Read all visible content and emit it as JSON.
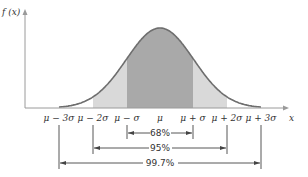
{
  "diagram": {
    "y_axis_label": "f (x)",
    "x_axis_label": "x",
    "colors": {
      "curve": "#6e6e6e",
      "band_1sigma": "#a9a9a9",
      "band_2sigma": "#d9d9d9",
      "axis": "#9a9a9a",
      "lines": "#444444"
    },
    "x_ticks": [
      {
        "label": "μ − 3σ",
        "x": 59
      },
      {
        "label": "μ − 2σ",
        "x": 93
      },
      {
        "label": "μ − σ",
        "x": 127
      },
      {
        "label": "μ",
        "x": 160
      },
      {
        "label": "μ + σ",
        "x": 193
      },
      {
        "label": "μ + 2σ",
        "x": 227
      },
      {
        "label": "μ + 3σ",
        "x": 261
      }
    ],
    "intervals": [
      {
        "label": "68%",
        "from": "μ − σ",
        "to": "μ + σ"
      },
      {
        "label": "95%",
        "from": "μ − 2σ",
        "to": "μ + 2σ"
      },
      {
        "label": "99.7%",
        "from": "μ − 3σ",
        "to": "μ + 3σ"
      }
    ]
  }
}
